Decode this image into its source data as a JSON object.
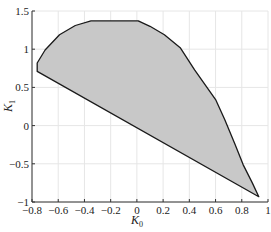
{
  "chart_data": {
    "type": "area",
    "title": "",
    "xlabel": "K0",
    "ylabel": "K1",
    "xlabel_main": "K",
    "xlabel_sub": "0",
    "ylabel_main": "K",
    "ylabel_sub": "1",
    "xlim": [
      -0.8,
      1.0
    ],
    "ylim": [
      -1.0,
      1.5
    ],
    "xticks": [
      -0.8,
      -0.6,
      -0.4,
      -0.2,
      0,
      0.2,
      0.4,
      0.6,
      0.8,
      1
    ],
    "xtick_labels": [
      "−0.8",
      "−0.6",
      "−0.4",
      "−0.2",
      "0",
      "0.2",
      "0.4",
      "0.6",
      "0.8",
      "1"
    ],
    "yticks": [
      -1,
      -0.5,
      0,
      0.5,
      1,
      1.5
    ],
    "ytick_labels": [
      "−1",
      "−0.5",
      "0",
      "0.5",
      "1",
      "1.5"
    ],
    "grid": true,
    "legend": null,
    "fill_color": "#c8c8c8",
    "edge_color": "#1a1a1a",
    "grid_color": "#e6e6e6",
    "series": [
      {
        "name": "stability region boundary",
        "x": [
          -0.76,
          -0.76,
          -0.7,
          -0.59,
          -0.47,
          -0.35,
          0.01,
          0.1,
          0.21,
          0.33,
          0.44,
          0.6,
          0.67,
          0.75,
          0.81,
          0.88,
          0.93
        ],
        "y": [
          0.71,
          0.82,
          0.99,
          1.19,
          1.31,
          1.37,
          1.37,
          1.3,
          1.19,
          1.02,
          0.73,
          0.34,
          0.08,
          -0.25,
          -0.51,
          -0.75,
          -0.93
        ]
      }
    ]
  }
}
